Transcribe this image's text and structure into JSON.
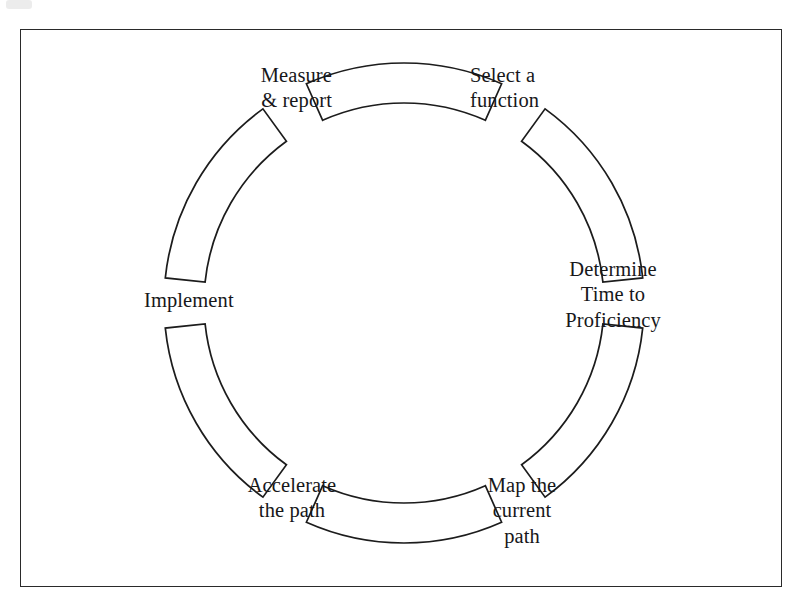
{
  "diagram": {
    "type": "cyclical-process-ring",
    "shape": "six detached annular sectors arranged in a clockwise circle",
    "stroke_color": "#1c1c1c",
    "fill_color": "#ffffff",
    "background_color": "#ffffff",
    "frame": {
      "name": "page-border",
      "color": "#2a2a2a"
    },
    "geometry": {
      "center_x": 404,
      "center_y": 303,
      "outer_radius": 240,
      "inner_radius": 200,
      "segment_span_degrees": 48,
      "gap_degrees": 12,
      "segment_count": 6
    },
    "steps": [
      {
        "index": 1,
        "label": "Select a\nfunction",
        "position": "top-right",
        "center_angle_deg": -60,
        "align": "left"
      },
      {
        "index": 2,
        "label": "Determine\nTime to\nProficiency",
        "position": "right",
        "center_angle_deg": 0,
        "align": "center"
      },
      {
        "index": 3,
        "label": "Map the\ncurrent\npath",
        "position": "bottom-right",
        "center_angle_deg": 60,
        "align": "center"
      },
      {
        "index": 4,
        "label": "Accelerate\nthe path",
        "position": "bottom-left",
        "center_angle_deg": 120,
        "align": "center"
      },
      {
        "index": 5,
        "label": "Implement",
        "position": "left",
        "center_angle_deg": 180,
        "align": "left"
      },
      {
        "index": 6,
        "label": "Measure\n& report",
        "position": "top-left",
        "center_angle_deg": 240,
        "align": "right"
      }
    ],
    "segments": [
      {
        "name": "segment-top",
        "center_angle_deg": 270
      },
      {
        "name": "segment-upper-right",
        "center_angle_deg": 330
      },
      {
        "name": "segment-lower-right",
        "center_angle_deg": 30
      },
      {
        "name": "segment-bottom",
        "center_angle_deg": 90
      },
      {
        "name": "segment-lower-left",
        "center_angle_deg": 150
      },
      {
        "name": "segment-upper-left",
        "center_angle_deg": 210
      }
    ]
  }
}
